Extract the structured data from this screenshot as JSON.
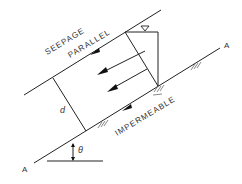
{
  "diagram": {
    "type": "infinite-slope-seepage",
    "labels": {
      "seepage": "SEEPAGE",
      "parallel": "PARALLEL",
      "impermeable": "IMPERMEABLE",
      "depth": "d",
      "angle": "θ",
      "section_left": "A",
      "section_right": "A"
    },
    "symbols": [
      "water-table-triangle",
      "flow-arrows",
      "ground-hatching"
    ]
  }
}
